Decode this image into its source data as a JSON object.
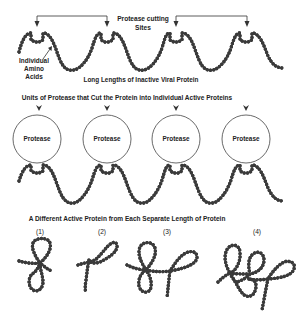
{
  "diagram": {
    "top_section": {
      "cutting_sites_label_line1": "Protease cutting",
      "cutting_sites_label_line2": "Sites",
      "amino_acids_label_line1": "Individual",
      "amino_acids_label_line2": "Amino",
      "amino_acids_label_line3": "Acids",
      "chain_label": "Long Lengths of Inactive Viral Protein"
    },
    "middle_section": {
      "title": "Units of Protease that Cut the Protein into Individual Active Proteins",
      "proteases": [
        {
          "label": "Protease"
        },
        {
          "label": "Protease"
        },
        {
          "label": "Protease"
        },
        {
          "label": "Protease"
        }
      ]
    },
    "bottom_section": {
      "title": "A Different Active Protein from Each Separate Length of Protein",
      "proteins": [
        {
          "label": "(1)"
        },
        {
          "label": "(2)"
        },
        {
          "label": "(3)"
        },
        {
          "label": "(4)"
        }
      ]
    },
    "colors": {
      "bead": "#3a3a3a",
      "text": "#222222",
      "background": "#ffffff"
    }
  }
}
